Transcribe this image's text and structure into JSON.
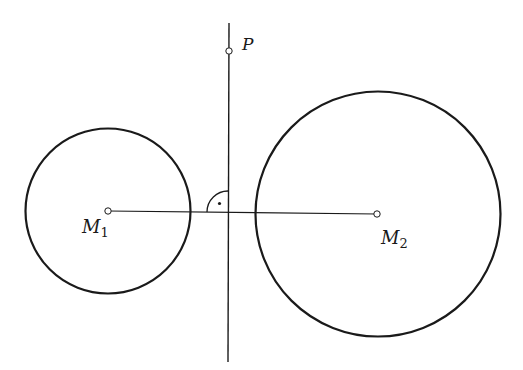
{
  "diagram": {
    "points": {
      "P": {
        "label": "P"
      },
      "M1": {
        "label": "M",
        "subscript": "1"
      },
      "M2": {
        "label": "M",
        "subscript": "2"
      }
    },
    "right_angle_marker": true,
    "colors": {
      "stroke": "#1a1a1a",
      "background": "#ffffff"
    }
  }
}
